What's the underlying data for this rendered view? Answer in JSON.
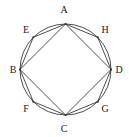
{
  "figure": {
    "canvas": {
      "width": 129,
      "height": 137
    },
    "background_color": "#ffffff",
    "stroke_color": "#3a3a3a",
    "label_color": "#1a1a1a",
    "circle": {
      "center_x": 65.5,
      "center_y": 69.5,
      "radius": 45.5,
      "stroke_width": 0.9
    },
    "vertices": [
      {
        "id": "A",
        "label": "A",
        "angle_deg": 90,
        "x": 65.5,
        "y": 24.0,
        "label_x": 64.0,
        "label_y": 10.0
      },
      {
        "id": "H",
        "label": "H",
        "angle_deg": 45,
        "x": 97.7,
        "y": 37.3,
        "label_x": 105.0,
        "label_y": 30.0
      },
      {
        "id": "D",
        "label": "D",
        "angle_deg": 0,
        "x": 111.0,
        "y": 69.5,
        "label_x": 119.0,
        "label_y": 70.0
      },
      {
        "id": "G",
        "label": "G",
        "angle_deg": 315,
        "x": 97.7,
        "y": 101.7,
        "label_x": 105.0,
        "label_y": 109.0
      },
      {
        "id": "C",
        "label": "C",
        "angle_deg": 270,
        "x": 65.5,
        "y": 115.0,
        "label_x": 64.0,
        "label_y": 129.0
      },
      {
        "id": "F",
        "label": "F",
        "angle_deg": 225,
        "x": 33.3,
        "y": 101.7,
        "label_x": 26.0,
        "label_y": 109.0
      },
      {
        "id": "B",
        "label": "B",
        "angle_deg": 180,
        "x": 20.0,
        "y": 69.5,
        "label_x": 13.0,
        "label_y": 70.0
      },
      {
        "id": "E",
        "label": "E",
        "angle_deg": 135,
        "x": 33.3,
        "y": 37.3,
        "label_x": 26.0,
        "label_y": 30.0
      }
    ],
    "edges": [
      {
        "name": "square-edge-AB",
        "from": "A",
        "to": "B"
      },
      {
        "name": "square-edge-BC",
        "from": "B",
        "to": "C"
      },
      {
        "name": "square-edge-CD",
        "from": "C",
        "to": "D"
      },
      {
        "name": "square-edge-DA",
        "from": "D",
        "to": "A"
      },
      {
        "name": "octagon-edge-AE",
        "from": "A",
        "to": "E"
      },
      {
        "name": "octagon-edge-EB",
        "from": "E",
        "to": "B"
      },
      {
        "name": "octagon-edge-BF",
        "from": "B",
        "to": "F"
      },
      {
        "name": "octagon-edge-FC",
        "from": "F",
        "to": "C"
      },
      {
        "name": "octagon-edge-CG",
        "from": "C",
        "to": "G"
      },
      {
        "name": "octagon-edge-GD",
        "from": "G",
        "to": "D"
      },
      {
        "name": "octagon-edge-DH",
        "from": "D",
        "to": "H"
      },
      {
        "name": "octagon-edge-HA",
        "from": "H",
        "to": "A"
      }
    ]
  }
}
